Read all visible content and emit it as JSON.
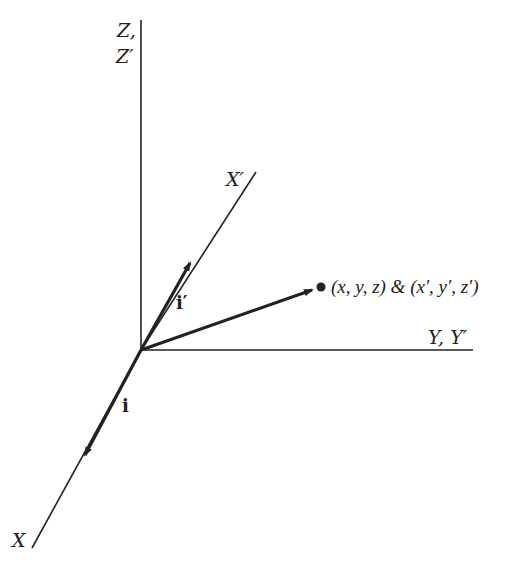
{
  "diagram": {
    "type": "coordinate-frame-rotation",
    "colors": {
      "line": "#222222",
      "background": "#ffffff"
    },
    "origin": {
      "x": 141,
      "y": 350
    },
    "axes": [
      {
        "id": "z",
        "label_line1": "Z,",
        "label_line2": "Z′"
      },
      {
        "id": "y",
        "label": "Y, Y′"
      },
      {
        "id": "x",
        "label": "X"
      },
      {
        "id": "x_prime",
        "label": "X′"
      }
    ],
    "vectors": [
      {
        "id": "i",
        "label": "i"
      },
      {
        "id": "i_prime",
        "label": "i′"
      },
      {
        "id": "position",
        "label": "(x, y, z) & (x′, y′, z′)"
      }
    ]
  }
}
